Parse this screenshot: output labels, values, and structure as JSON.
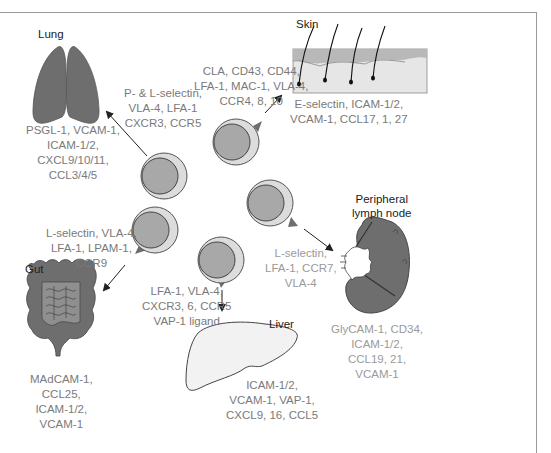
{
  "organs": {
    "lung": {
      "name": "Lung",
      "endothelial_ligands": [
        "PSGL-1, VCAM-1,",
        "ICAM-1/2,",
        "CXCL9/10/11,",
        "CCL3/4/5"
      ],
      "lymphocyte_receptors": [
        "P- & L-selectin,",
        "VLA-4, LFA-1",
        "CXCR3, CCR5"
      ]
    },
    "skin": {
      "name": "Skin",
      "endothelial_ligands": [
        "E-selectin, ICAM-1/2,",
        "VCAM-1, CCL17, 1, 27"
      ],
      "lymphocyte_receptors": [
        "CLA, CD43, CD44,",
        "LFA-1, MAC-1, VLA-4,",
        "CCR4, 8, 10"
      ]
    },
    "gut": {
      "name": "Gut",
      "endothelial_ligands": [
        "MAdCAM-1,",
        "CCL25,",
        "ICAM-1/2,",
        "VCAM-1"
      ],
      "lymphocyte_receptors": [
        "L-selectin, VLA-4,",
        "LFA-1, LPAM-1,",
        "CCR9"
      ]
    },
    "liver": {
      "name": "Liver",
      "endothelial_ligands": [
        "ICAM-1/2,",
        "VCAM-1, VAP-1,",
        "CXCL9, 16, CCL5"
      ],
      "lymphocyte_receptors": [
        "LFA-1, VLA-4,",
        "CXCR3, 6, CCR5",
        "VAP-1 ligand"
      ]
    },
    "lymph_node": {
      "name": [
        "Peripheral",
        "lymph node"
      ],
      "endothelial_ligands": [
        "GlyCAM-1, CD34,",
        "ICAM-1/2,",
        "CCL19, 21,",
        "VCAM-1"
      ],
      "lymphocyte_receptors": [
        "L-selectin,",
        "LFA-1, CCR7,",
        "VLA-4"
      ]
    }
  },
  "colors": {
    "organ_dark": "#6e6e6e",
    "organ_mid": "#8f8f8f",
    "skin_top": "#b8b8b8",
    "skin_body": "#e6e6e6",
    "liver_fill": "#f2f2f2",
    "cell_outer": "#dcdcdc",
    "cell_nucleus": "#a8a8a8",
    "text_gray": "#7a7a7a",
    "text_light": "#9a9a9a"
  }
}
